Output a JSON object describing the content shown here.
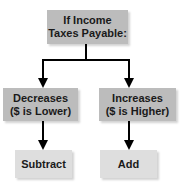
{
  "diagram": {
    "root": {
      "line1": "If Income",
      "line2": "Taxes Payable:"
    },
    "branches": [
      {
        "line1": "Decreases",
        "line2": "($ is Lower)",
        "result": "Subtract"
      },
      {
        "line1": "Increases",
        "line2": "($ is Higher)",
        "result": "Add"
      }
    ]
  },
  "colors": {
    "decision_box": "#bcbcbc",
    "result_box": "#dedede",
    "connector": "#000000"
  }
}
